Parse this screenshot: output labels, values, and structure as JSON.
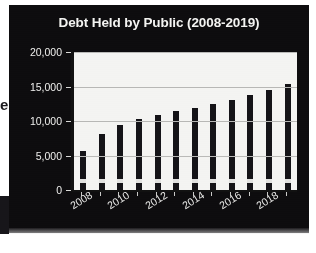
{
  "page": {
    "background_color": "#ffffff",
    "margin_letter_fragment": "e"
  },
  "chart_card": {
    "background_color": "#0d0c0e",
    "plot_background_color": "#f4f4f2",
    "bar_color": "#141317",
    "text_color": "#f4f4f2",
    "gridline_color": "#b9b9b7"
  },
  "chart_data": {
    "type": "bar",
    "title": "Debt Held by Public (2008-2019)",
    "xlabel": "",
    "ylabel": "",
    "categories": [
      "2008",
      "2009",
      "2010",
      "2011",
      "2012",
      "2013",
      "2014",
      "2015",
      "2016",
      "2017",
      "2018",
      "2019"
    ],
    "values": [
      5650,
      8100,
      9400,
      10250,
      10800,
      11500,
      11900,
      12400,
      13100,
      13800,
      14500,
      15350
    ],
    "ylim": [
      0,
      20000
    ],
    "ytick_labels": [
      "0",
      "5,000",
      "10,000",
      "15,000",
      "20,000"
    ],
    "ytick_values": [
      0,
      5000,
      10000,
      15000,
      20000
    ],
    "xtick_labels": [
      "2008",
      "2010",
      "2012",
      "2014",
      "2016",
      "2018"
    ],
    "xtick_label_rotation": -32,
    "grid": "horizontal",
    "legend": "none"
  }
}
